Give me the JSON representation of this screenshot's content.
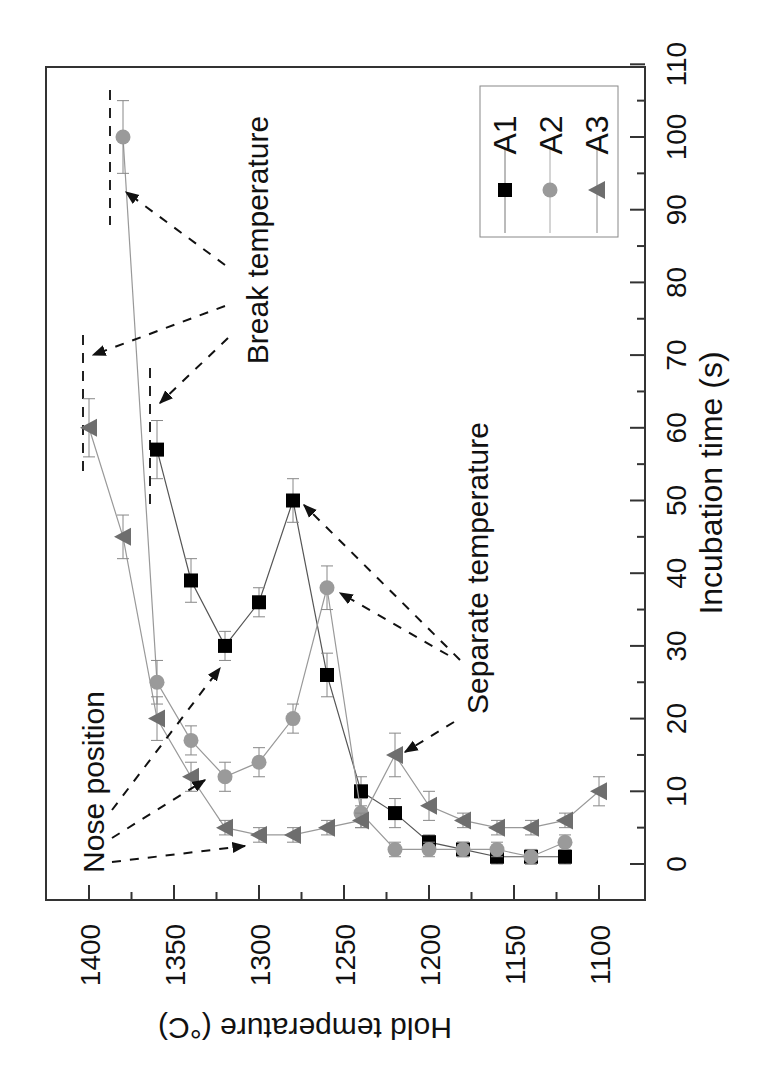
{
  "chart_data": {
    "type": "line",
    "orientation_note_visible": "figure rendered rotated 90 degrees",
    "title": "",
    "xlabel": "Hold temperature (°C)",
    "ylabel": "Incubation time (s)",
    "xlim": [
      1410,
      1080
    ],
    "ylim": [
      -5,
      110
    ],
    "x_ticks": [
      1400,
      1350,
      1300,
      1250,
      1200,
      1150,
      1100
    ],
    "y_ticks": [
      0,
      10,
      20,
      30,
      40,
      50,
      60,
      70,
      80,
      90,
      100,
      110
    ],
    "legend": {
      "position": "top-right",
      "entries": [
        "A1",
        "A2",
        "A3"
      ]
    },
    "grid": false,
    "series": [
      {
        "name": "A1",
        "marker": "square",
        "color": "#000000",
        "x": [
          1360,
          1340,
          1320,
          1300,
          1280,
          1260,
          1240,
          1220,
          1200,
          1180,
          1160,
          1140,
          1120
        ],
        "y": [
          57,
          39,
          30,
          36,
          50,
          26,
          10,
          7,
          3,
          2,
          1,
          1,
          1
        ],
        "err": [
          4,
          3,
          2,
          2,
          3,
          3,
          2,
          2,
          1,
          1,
          1,
          1,
          1
        ]
      },
      {
        "name": "A2",
        "marker": "circle",
        "color": "#9a9a9a",
        "x": [
          1380,
          1360,
          1340,
          1320,
          1300,
          1280,
          1260,
          1240,
          1220,
          1200,
          1180,
          1160,
          1140,
          1120
        ],
        "y": [
          100,
          25,
          17,
          12,
          14,
          20,
          38,
          7,
          2,
          2,
          2,
          2,
          1,
          3
        ],
        "err": [
          5,
          3,
          2,
          2,
          2,
          2,
          3,
          2,
          1,
          1,
          1,
          1,
          1,
          1
        ]
      },
      {
        "name": "A3",
        "marker": "triangle",
        "color": "#6e6e6e",
        "x": [
          1400,
          1380,
          1360,
          1340,
          1320,
          1300,
          1280,
          1260,
          1240,
          1220,
          1200,
          1180,
          1160,
          1140,
          1120,
          1100
        ],
        "y": [
          60,
          45,
          20,
          12,
          5,
          4,
          4,
          5,
          6,
          15,
          8,
          6,
          5,
          5,
          6,
          10
        ],
        "err": [
          4,
          3,
          3,
          2,
          1,
          1,
          1,
          1,
          1,
          3,
          2,
          1,
          1,
          1,
          1,
          2
        ]
      }
    ],
    "annotations": [
      {
        "text": "Break temperature",
        "targets": [
          [
            1400,
            60
          ],
          [
            1360,
            57
          ],
          [
            1380,
            100
          ]
        ]
      },
      {
        "text": "Separate temperature",
        "targets": [
          [
            1280,
            50
          ],
          [
            1260,
            38
          ],
          [
            1220,
            15
          ]
        ]
      },
      {
        "text": "Nose position",
        "targets": [
          [
            1320,
            30
          ],
          [
            1320,
            12
          ],
          [
            1300,
            4
          ]
        ]
      }
    ]
  },
  "labels": {
    "xlabel": "Hold temperature (°C)",
    "ylabel": "Incubation time (s)",
    "break": "Break temperature",
    "separate": "Separate temperature",
    "nose": "Nose position",
    "legend": [
      "A1",
      "A2",
      "A3"
    ]
  }
}
